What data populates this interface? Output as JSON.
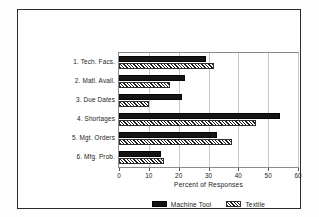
{
  "chart_data": {
    "type": "bar",
    "orientation": "horizontal",
    "title": "",
    "xlabel": "Percent of Responses",
    "ylabel": "",
    "xlim": [
      0,
      60
    ],
    "xticks": [
      0,
      10,
      20,
      30,
      40,
      50,
      60
    ],
    "grid": true,
    "legend_position": "bottom",
    "categories": [
      "1. Tech. Facs.",
      "2. Matl. Avail.",
      "3. Due Dates",
      "4. Shortages",
      "5. Mgt. Orders",
      "6. Mfg. Prob."
    ],
    "series": [
      {
        "name": "Machine Tool",
        "pattern": "solid",
        "color": "#151515",
        "values": [
          29,
          22,
          21,
          54,
          33,
          14
        ]
      },
      {
        "name": "Textile",
        "pattern": "diagonal-hatch",
        "color": "#1c1c1c",
        "values": [
          32,
          17,
          10,
          46,
          38,
          15
        ]
      }
    ]
  },
  "axis": {
    "x_tick_labels": [
      "0",
      "10",
      "20",
      "30",
      "40",
      "50",
      "60"
    ],
    "x_title": "Percent of Responses"
  },
  "legend": {
    "entries": [
      {
        "label": "Machine Tool"
      },
      {
        "label": "Textile"
      }
    ]
  }
}
